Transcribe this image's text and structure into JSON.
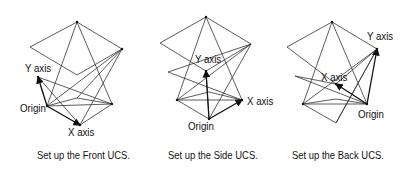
{
  "figures": [
    {
      "id": "front",
      "caption": "Set up the Front UCS.",
      "labels": {
        "y_axis": "Y axis",
        "origin": "Origin",
        "x_axis": "X axis"
      },
      "lines": [
        [
          30,
          47,
          77,
          22
        ],
        [
          77,
          22,
          122,
          49
        ],
        [
          30,
          47,
          77,
          75
        ],
        [
          77,
          75,
          122,
          49
        ],
        [
          77,
          22,
          47,
          106
        ],
        [
          77,
          22,
          112,
          104
        ],
        [
          122,
          49,
          47,
          106
        ],
        [
          122,
          49,
          80,
          125
        ],
        [
          122,
          49,
          77,
          98
        ],
        [
          38,
          77,
          112,
          104
        ],
        [
          38,
          77,
          80,
          125
        ],
        [
          47,
          106,
          77,
          98
        ],
        [
          77,
          98,
          112,
          104
        ],
        [
          47,
          106,
          112,
          104
        ],
        [
          112,
          104,
          80,
          125
        ]
      ],
      "arrows": [
        [
          47,
          106,
          38,
          77
        ],
        [
          47,
          106,
          80,
          125
        ]
      ],
      "points": [
        [
          77,
          22
        ],
        [
          122,
          49
        ],
        [
          38,
          77
        ],
        [
          47,
          106
        ],
        [
          80,
          125
        ],
        [
          112,
          104
        ]
      ]
    },
    {
      "id": "side",
      "caption": "Set up the Side UCS.",
      "labels": {
        "y_axis": "Y axis",
        "origin": "Origin",
        "x_axis": "X axis"
      },
      "lines": [
        [
          160,
          43,
          206,
          17
        ],
        [
          206,
          17,
          251,
          44
        ],
        [
          160,
          43,
          206,
          71
        ],
        [
          206,
          71,
          251,
          44
        ],
        [
          206,
          17,
          177,
          100
        ],
        [
          206,
          17,
          242,
          100
        ],
        [
          251,
          44,
          177,
          100
        ],
        [
          251,
          44,
          209,
          119
        ],
        [
          168,
          72,
          251,
          44
        ],
        [
          168,
          72,
          242,
          100
        ],
        [
          177,
          100,
          209,
          92
        ],
        [
          209,
          92,
          242,
          100
        ],
        [
          177,
          100,
          242,
          100
        ],
        [
          177,
          100,
          209,
          119
        ],
        [
          206,
          71,
          209,
          119
        ]
      ],
      "arrows": [
        [
          209,
          119,
          206,
          71
        ],
        [
          209,
          119,
          242,
          100
        ]
      ],
      "points": [
        [
          206,
          17
        ],
        [
          206,
          71
        ],
        [
          209,
          119
        ],
        [
          242,
          100
        ],
        [
          177,
          100
        ]
      ]
    },
    {
      "id": "back",
      "caption": "Set up the Back UCS.",
      "labels": {
        "y_axis": "Y axis",
        "origin": "Origin",
        "x_axis": "X axis"
      },
      "lines": [
        [
          287,
          47,
          332,
          22
        ],
        [
          332,
          22,
          377,
          49
        ],
        [
          287,
          47,
          336,
          84
        ],
        [
          336,
          84,
          377,
          49
        ],
        [
          332,
          22,
          303,
          104
        ],
        [
          332,
          22,
          367,
          104
        ],
        [
          377,
          49,
          303,
          104
        ],
        [
          377,
          49,
          336,
          123
        ],
        [
          295,
          76,
          336,
          84
        ],
        [
          295,
          76,
          367,
          104
        ],
        [
          303,
          104,
          336,
          99
        ],
        [
          336,
          99,
          367,
          104
        ],
        [
          303,
          104,
          367,
          104
        ],
        [
          303,
          104,
          336,
          123
        ],
        [
          336,
          123,
          377,
          49
        ]
      ],
      "arrows": [
        [
          367,
          104,
          377,
          49
        ],
        [
          367,
          104,
          336,
          84
        ]
      ],
      "points": [
        [
          332,
          22
        ],
        [
          377,
          49
        ],
        [
          336,
          84
        ],
        [
          367,
          104
        ],
        [
          303,
          104
        ]
      ]
    }
  ],
  "label_positions": {
    "front": {
      "y_axis": [
        25,
        62
      ],
      "origin": [
        20,
        102
      ],
      "x_axis": [
        68,
        126
      ]
    },
    "side": {
      "y_axis": [
        195,
        53
      ],
      "origin": [
        188,
        120
      ],
      "x_axis": [
        247,
        95
      ]
    },
    "back": {
      "y_axis": [
        367,
        30
      ],
      "origin": [
        358,
        108
      ],
      "x_axis": [
        321,
        71
      ]
    }
  },
  "colors": {
    "line": "#333333",
    "text": "#111111",
    "background": "#ffffff"
  }
}
